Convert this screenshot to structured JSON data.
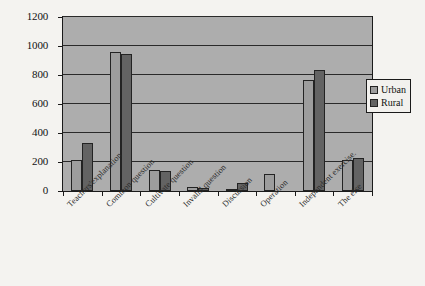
{
  "chart_data": {
    "type": "bar",
    "title": "",
    "xlabel": "",
    "ylabel": "",
    "ylim": [
      0,
      1200
    ],
    "ytick_step": 200,
    "yticks": [
      "1200",
      "1000",
      "800",
      "600",
      "400",
      "200",
      "0"
    ],
    "grid": "horizontal",
    "legend_position": "top-right-inside",
    "categories": [
      "Teachers'explanation",
      "Common question",
      "Cultivate question",
      "Invalid question",
      "Discussion",
      "Operation",
      "Independent exercise.",
      "The else"
    ],
    "series": [
      {
        "name": "Urban",
        "color": "#9d9d9d",
        "values": [
          215,
          960,
          145,
          25,
          15,
          120,
          765,
          215
        ]
      },
      {
        "name": "Rural",
        "color": "#636363",
        "values": [
          330,
          945,
          140,
          20,
          55,
          0,
          835,
          225
        ]
      }
    ]
  },
  "legend": {
    "items": [
      {
        "label": "Urban",
        "swatch": "urban"
      },
      {
        "label": "Rural",
        "swatch": "rural"
      }
    ]
  },
  "colors": {
    "plot_background": "#adadad",
    "page_background": "#f4f3f0",
    "axis": "#1a1a1a",
    "urban": "#9d9d9d",
    "rural": "#636363"
  }
}
